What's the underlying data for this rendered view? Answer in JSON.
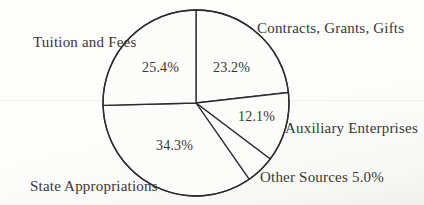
{
  "page": {
    "background": "#fbfbf9",
    "text_color": "#373737"
  },
  "chart_data": {
    "type": "pie",
    "title": "",
    "start_angle_deg": 0,
    "direction": "clockwise",
    "stroke_color": "#2c2c2c",
    "paper_fill": "#fcfcfb",
    "slices": [
      {
        "name": "Contracts, Grants, Gifts",
        "value": 23.2
      },
      {
        "name": "Auxiliary Enterprises",
        "value": 12.1
      },
      {
        "name": "Other Sources",
        "value": 5.0
      },
      {
        "name": "State Appropriations",
        "value": 34.3
      },
      {
        "name": "Tuition and Fees",
        "value": 25.4
      }
    ],
    "legend": "none",
    "labels_outside": true,
    "percent_labels_inside": true
  },
  "labels": {
    "contracts": "Contracts, Grants, Gifts",
    "tuition": "Tuition and Fees",
    "auxiliary": "Auxiliary Enterprises",
    "other_sources": "Other Sources 5.0%",
    "state": "State Appropriations",
    "pct_tuition": "25.4%",
    "pct_contracts": "23.2%",
    "pct_auxiliary": "12.1%",
    "pct_state": "34.3%"
  }
}
